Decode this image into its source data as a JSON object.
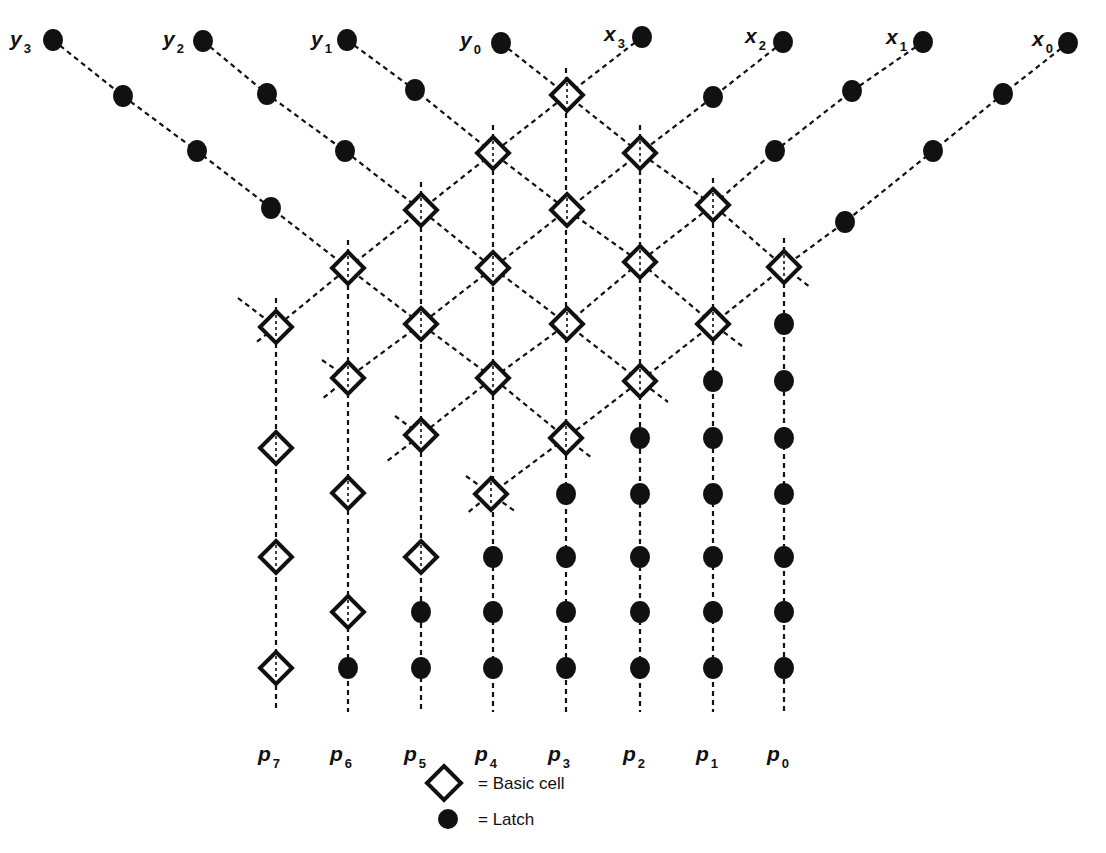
{
  "diagram": {
    "colors": {
      "ink": "#111111",
      "background": "#ffffff"
    },
    "input_labels": [
      {
        "id": "y3",
        "base": "y",
        "sub": "3",
        "x": 10,
        "y": 30
      },
      {
        "id": "y2",
        "base": "y",
        "sub": "2",
        "x": 163,
        "y": 30
      },
      {
        "id": "y1",
        "base": "y",
        "sub": "1",
        "x": 311,
        "y": 30
      },
      {
        "id": "y0",
        "base": "y",
        "sub": "0",
        "x": 460,
        "y": 31
      },
      {
        "id": "x3",
        "base": "x",
        "sub": "3",
        "x": 604,
        "y": 25
      },
      {
        "id": "x2",
        "base": "x",
        "sub": "2",
        "x": 745,
        "y": 27
      },
      {
        "id": "x1",
        "base": "x",
        "sub": "1",
        "x": 886,
        "y": 28
      },
      {
        "id": "x0",
        "base": "x",
        "sub": "0",
        "x": 1032,
        "y": 30
      }
    ],
    "output_labels": [
      {
        "id": "p7",
        "base": "p",
        "sub": "7",
        "x": 258,
        "y": 745
      },
      {
        "id": "p6",
        "base": "p",
        "sub": "6",
        "x": 330,
        "y": 745
      },
      {
        "id": "p5",
        "base": "p",
        "sub": "5",
        "x": 404,
        "y": 745
      },
      {
        "id": "p4",
        "base": "p",
        "sub": "4",
        "x": 475,
        "y": 745
      },
      {
        "id": "p3",
        "base": "p",
        "sub": "3",
        "x": 548,
        "y": 745
      },
      {
        "id": "p2",
        "base": "p",
        "sub": "2",
        "x": 623,
        "y": 745
      },
      {
        "id": "p1",
        "base": "p",
        "sub": "1",
        "x": 696,
        "y": 745
      },
      {
        "id": "p0",
        "base": "p",
        "sub": "0",
        "x": 767,
        "y": 745
      }
    ],
    "columns": [
      {
        "id": "p7",
        "x": 276,
        "y1": 298,
        "y2": 712
      },
      {
        "id": "p6",
        "x": 348,
        "y1": 240,
        "y2": 712
      },
      {
        "id": "p5",
        "x": 421,
        "y1": 182,
        "y2": 712
      },
      {
        "id": "p4",
        "x": 493,
        "y1": 125,
        "y2": 712
      },
      {
        "id": "p3",
        "x": 566,
        "y1": 68,
        "y2": 712
      },
      {
        "id": "p2",
        "x": 640,
        "y1": 125,
        "y2": 712
      },
      {
        "id": "p1",
        "x": 713,
        "y1": 178,
        "y2": 712
      },
      {
        "id": "p0",
        "x": 784,
        "y1": 238,
        "y2": 712
      }
    ],
    "chains": [
      {
        "id": "y3-chain",
        "points": [
          [
            53,
            40
          ],
          [
            123,
            96
          ],
          [
            197,
            151
          ],
          [
            271,
            208
          ],
          [
            348,
            268
          ],
          [
            421,
            324
          ],
          [
            493,
            378
          ],
          [
            566,
            438
          ],
          [
            592,
            458
          ]
        ]
      },
      {
        "id": "y2-chain",
        "points": [
          [
            203,
            41
          ],
          [
            267,
            94
          ],
          [
            345,
            151
          ],
          [
            421,
            210
          ],
          [
            493,
            268
          ],
          [
            567,
            324
          ],
          [
            640,
            381
          ],
          [
            668,
            402
          ]
        ]
      },
      {
        "id": "y1-chain",
        "points": [
          [
            347,
            40
          ],
          [
            415,
            90
          ],
          [
            493,
            153
          ],
          [
            567,
            210
          ],
          [
            640,
            262
          ],
          [
            713,
            324
          ],
          [
            742,
            346
          ]
        ]
      },
      {
        "id": "y0-chain",
        "points": [
          [
            501,
            43
          ],
          [
            567,
            95
          ],
          [
            640,
            153
          ],
          [
            713,
            205
          ],
          [
            784,
            267
          ],
          [
            810,
            287
          ]
        ]
      },
      {
        "id": "x3-chain",
        "points": [
          [
            642,
            37
          ],
          [
            567,
            95
          ],
          [
            493,
            153
          ],
          [
            421,
            210
          ],
          [
            348,
            268
          ],
          [
            276,
            327
          ],
          [
            254,
            344
          ]
        ]
      },
      {
        "id": "x2-chain",
        "points": [
          [
            783,
            42
          ],
          [
            713,
            97
          ],
          [
            640,
            153
          ],
          [
            567,
            210
          ],
          [
            493,
            268
          ],
          [
            421,
            324
          ],
          [
            348,
            378
          ],
          [
            322,
            399
          ]
        ]
      },
      {
        "id": "x1-chain",
        "points": [
          [
            923,
            42
          ],
          [
            852,
            91
          ],
          [
            775,
            151
          ],
          [
            713,
            205
          ],
          [
            640,
            262
          ],
          [
            567,
            324
          ],
          [
            493,
            378
          ],
          [
            421,
            435
          ],
          [
            386,
            462
          ]
        ]
      },
      {
        "id": "x0-chain",
        "points": [
          [
            1068,
            43
          ],
          [
            1003,
            94
          ],
          [
            933,
            151
          ],
          [
            845,
            222
          ],
          [
            784,
            267
          ],
          [
            713,
            324
          ],
          [
            640,
            381
          ],
          [
            566,
            438
          ],
          [
            491,
            494
          ],
          [
            466,
            514
          ]
        ]
      }
    ],
    "stubs": [
      {
        "id": "stub-1",
        "points": [
          [
            238,
            298
          ],
          [
            276,
            327
          ]
        ]
      },
      {
        "id": "stub-2",
        "points": [
          [
            322,
            360
          ],
          [
            348,
            378
          ]
        ]
      },
      {
        "id": "stub-3",
        "points": [
          [
            395,
            416
          ],
          [
            421,
            435
          ]
        ]
      },
      {
        "id": "stub-4",
        "points": [
          [
            466,
            476
          ],
          [
            491,
            494
          ],
          [
            516,
            512
          ]
        ]
      }
    ],
    "basic_cells": [
      [
        567,
        95
      ],
      [
        493,
        153
      ],
      [
        640,
        153
      ],
      [
        421,
        210
      ],
      [
        567,
        210
      ],
      [
        713,
        205
      ],
      [
        348,
        268
      ],
      [
        493,
        268
      ],
      [
        640,
        262
      ],
      [
        784,
        267
      ],
      [
        276,
        327
      ],
      [
        421,
        324
      ],
      [
        567,
        324
      ],
      [
        713,
        324
      ],
      [
        348,
        378
      ],
      [
        493,
        378
      ],
      [
        640,
        381
      ],
      [
        421,
        435
      ],
      [
        566,
        438
      ],
      [
        491,
        494
      ],
      [
        276,
        448
      ],
      [
        348,
        493
      ],
      [
        276,
        557
      ],
      [
        421,
        557
      ],
      [
        348,
        612
      ],
      [
        276,
        668
      ]
    ],
    "latches": [
      [
        53,
        40
      ],
      [
        203,
        41
      ],
      [
        347,
        40
      ],
      [
        501,
        43
      ],
      [
        642,
        37
      ],
      [
        783,
        42
      ],
      [
        923,
        42
      ],
      [
        1068,
        43
      ],
      [
        123,
        96
      ],
      [
        267,
        94
      ],
      [
        415,
        90
      ],
      [
        713,
        97
      ],
      [
        852,
        91
      ],
      [
        1003,
        94
      ],
      [
        197,
        151
      ],
      [
        345,
        151
      ],
      [
        775,
        151
      ],
      [
        933,
        151
      ],
      [
        271,
        208
      ],
      [
        845,
        222
      ],
      [
        784,
        324
      ],
      [
        713,
        381
      ],
      [
        784,
        381
      ],
      [
        640,
        438
      ],
      [
        713,
        438
      ],
      [
        784,
        438
      ],
      [
        566,
        494
      ],
      [
        640,
        494
      ],
      [
        713,
        494
      ],
      [
        784,
        494
      ],
      [
        493,
        557
      ],
      [
        566,
        557
      ],
      [
        640,
        557
      ],
      [
        713,
        557
      ],
      [
        784,
        557
      ],
      [
        421,
        612
      ],
      [
        493,
        612
      ],
      [
        566,
        612
      ],
      [
        640,
        612
      ],
      [
        713,
        612
      ],
      [
        784,
        612
      ],
      [
        348,
        668
      ],
      [
        421,
        668
      ],
      [
        493,
        668
      ],
      [
        566,
        668
      ],
      [
        640,
        668
      ],
      [
        713,
        668
      ],
      [
        784,
        668
      ]
    ],
    "legend": {
      "basic_cell_label": "= Basic cell",
      "latch_label": "= Latch"
    }
  }
}
